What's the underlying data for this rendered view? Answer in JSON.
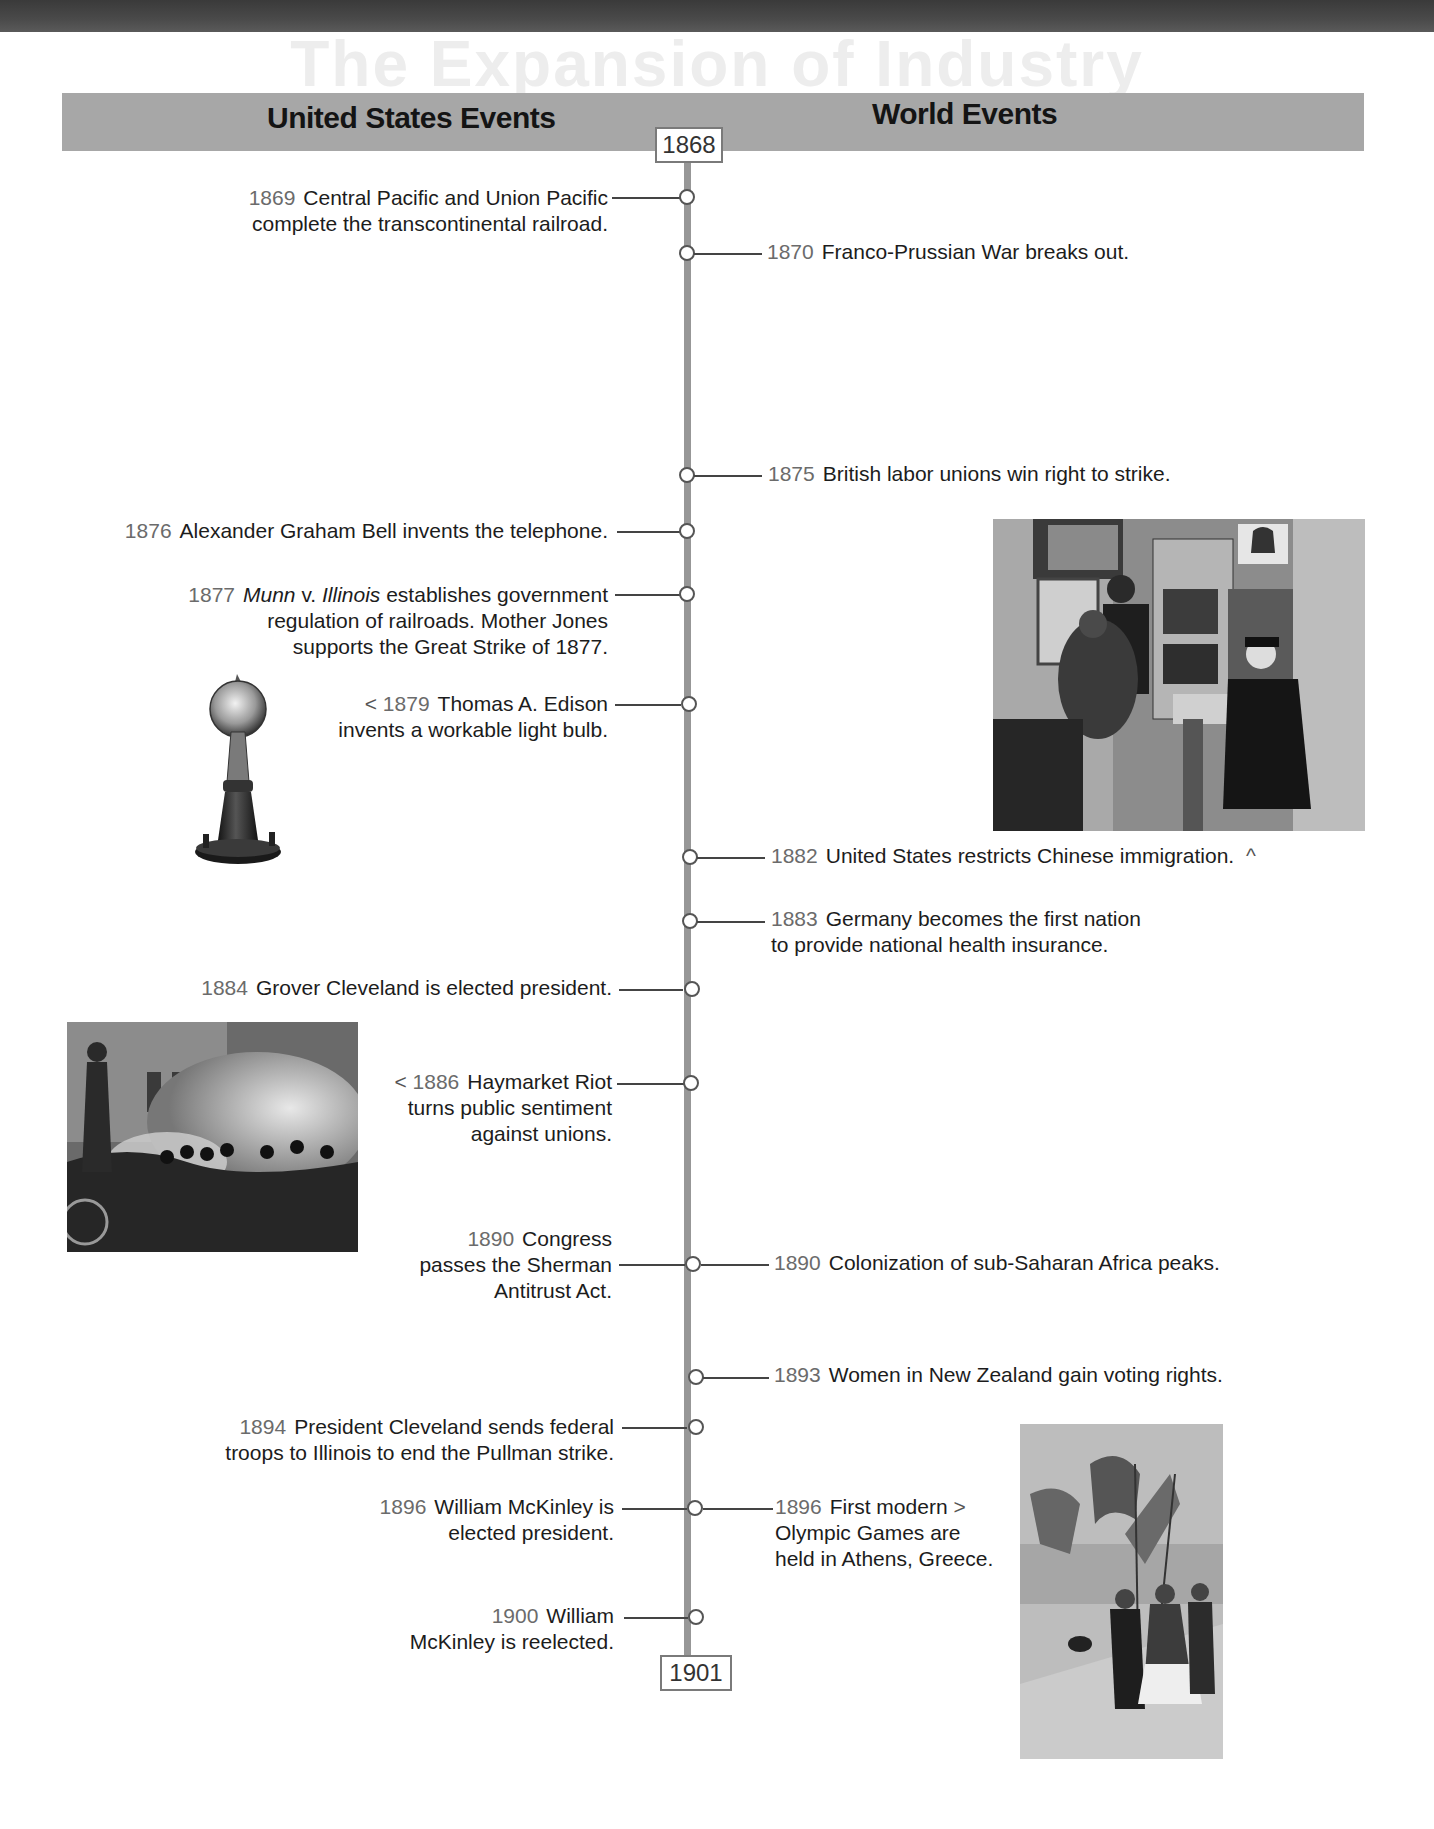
{
  "page": {
    "ghost_title": "The Expansion of Industry"
  },
  "header": {
    "left_label": "United States Events",
    "right_label": "World Events"
  },
  "timeline": {
    "start_year": "1868",
    "end_year": "1901"
  },
  "us_events": [
    {
      "year": "1869",
      "lines": [
        "Central Pacific and Union Pacific",
        "complete the transcontinental railroad."
      ]
    },
    {
      "year": "1876",
      "lines": [
        "Alexander Graham Bell invents the telephone."
      ]
    },
    {
      "year": "1877",
      "italic_a": "Munn",
      "mid": " v. ",
      "italic_b": "Illinois",
      "rest": " establishes government",
      "lines": [
        "regulation of railroads. Mother Jones",
        "supports the Great Strike of 1877."
      ]
    },
    {
      "year": "1879",
      "arrow": "<",
      "lines": [
        "Thomas A. Edison",
        "invents a workable light bulb."
      ]
    },
    {
      "year": "1884",
      "lines": [
        "Grover Cleveland is elected president."
      ]
    },
    {
      "year": "1886",
      "arrow": "<",
      "lines": [
        "Haymarket Riot",
        "turns public sentiment",
        "against unions."
      ]
    },
    {
      "year": "1890",
      "lines": [
        "Congress",
        "passes the Sherman",
        "Antitrust Act."
      ]
    },
    {
      "year": "1894",
      "lines": [
        "President Cleveland sends federal",
        "troops to Illinois to end the Pullman strike."
      ]
    },
    {
      "year": "1896",
      "lines": [
        "William McKinley is",
        "elected president."
      ]
    },
    {
      "year": "1900",
      "lines": [
        "William",
        "McKinley is reelected."
      ]
    }
  ],
  "world_events": [
    {
      "year": "1870",
      "lines": [
        "Franco-Prussian War breaks out."
      ]
    },
    {
      "year": "1875",
      "lines": [
        "British labor unions win right to strike."
      ]
    },
    {
      "year": "1882",
      "arrow": "^",
      "lines": [
        "United States restricts Chinese immigration."
      ]
    },
    {
      "year": "1883",
      "lines": [
        "Germany becomes the first nation",
        "to provide national health insurance."
      ]
    },
    {
      "year": "1890",
      "lines": [
        "Colonization of sub-Saharan Africa peaks."
      ]
    },
    {
      "year": "1893",
      "lines": [
        "Women in New Zealand gain voting rights."
      ]
    },
    {
      "year": "1896",
      "arrow": ">",
      "lines": [
        "First modern",
        "Olympic Games are",
        "held in Athens, Greece."
      ]
    }
  ],
  "images": {
    "light_bulb": "Edison light bulb",
    "telephone_exchange": "Chinese telephone exchange operators",
    "haymarket": "Haymarket Riot engraving",
    "olympics": "1896 Olympic Games procession"
  },
  "colors": {
    "header_bar": "#a7a7a7",
    "spine": "#979797",
    "year_text": "#6b6b6b",
    "top_band": "#444444"
  }
}
